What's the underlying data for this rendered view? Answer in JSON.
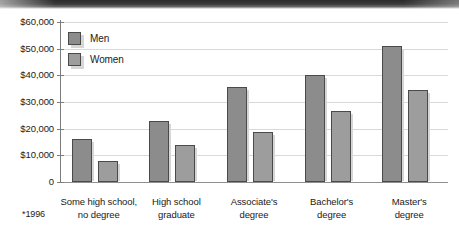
{
  "chart_data": {
    "type": "bar",
    "title": "",
    "xlabel": "",
    "ylabel": "",
    "ylim": [
      0,
      60000
    ],
    "grid": true,
    "legend_position": "top-left",
    "categories": [
      "Some high school,\nno degree",
      "High school\ngraduate",
      "Associate's\ndegree",
      "Bachelor's\ndegree",
      "Master's\ndegree"
    ],
    "category_lines": [
      [
        "Some high school,",
        "no degree"
      ],
      [
        "High school",
        "graduate"
      ],
      [
        "Associate's",
        "degree"
      ],
      [
        "Bachelor's",
        "degree"
      ],
      [
        "Master's",
        "degree"
      ]
    ],
    "series": [
      {
        "name": "Men",
        "values": [
          16000,
          22800,
          35500,
          40000,
          51000
        ]
      },
      {
        "name": "Women",
        "values": [
          8000,
          14000,
          18700,
          26500,
          34500
        ]
      }
    ],
    "ytick_labels": [
      "$60,000",
      "$50,000",
      "$40,000",
      "$30,000",
      "$20,000",
      "$10,000",
      "0"
    ],
    "ytick_values": [
      60000,
      50000,
      40000,
      30000,
      20000,
      10000,
      0
    ],
    "annotations": [
      "*1996"
    ]
  },
  "footnote": "*1996",
  "legend": {
    "items": [
      {
        "label": "Men",
        "color": "#8c8c8c"
      },
      {
        "label": "Women",
        "color": "#9d9d9d"
      }
    ]
  },
  "colors": {
    "men": "#8c8c8c",
    "women": "#9d9d9d",
    "gridline": "#d9d9d9",
    "axis": "#7d7d7d",
    "bar_border": "#4a4a4a",
    "background": "#ffffff"
  }
}
